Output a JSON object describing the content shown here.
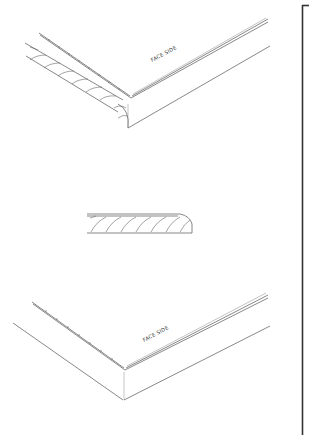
{
  "drawing": {
    "top_view": {
      "label": "FACE SIDE"
    },
    "section_view": {
      "label": ""
    },
    "bottom_view": {
      "label": "FACE SIDE"
    }
  },
  "colors": {
    "line": "#555555",
    "border": "#333333",
    "background": "#ffffff"
  }
}
